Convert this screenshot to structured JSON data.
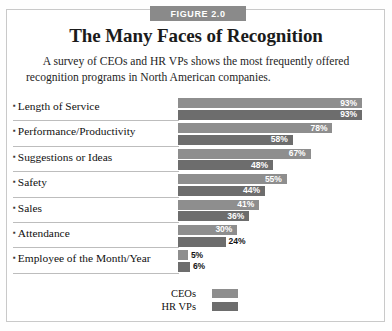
{
  "figure": {
    "banner_label": "FIGURE 2.0",
    "title": "The Many Faces of Recognition",
    "subtitle_line1": "A survey of CEOs and HR VPs shows the most frequently offered",
    "subtitle_line2": "recognition programs in North American companies."
  },
  "legend": {
    "items": [
      {
        "label": "CEOs",
        "color": "#8e8e8e"
      },
      {
        "label": "HR VPs",
        "color": "#6d6d6d"
      }
    ]
  },
  "rows": [
    {
      "label": "Length of Service",
      "ceo": "93%",
      "hr": "93%"
    },
    {
      "label": "Performance/Productivity",
      "ceo": "78%",
      "hr": "58%"
    },
    {
      "label": "Suggestions or Ideas",
      "ceo": "67%",
      "hr": "48%"
    },
    {
      "label": "Safety",
      "ceo": "55%",
      "hr": "44%"
    },
    {
      "label": "Sales",
      "ceo": "41%",
      "hr": "36%"
    },
    {
      "label": "Attendance",
      "ceo": "30%",
      "hr": "24%"
    },
    {
      "label": "Employee of the Month/Year",
      "ceo": "5%",
      "hr": "6%"
    }
  ],
  "chart_data": {
    "type": "bar",
    "orientation": "horizontal",
    "title": "The Many Faces of Recognition",
    "subtitle": "A survey of CEOs and HR VPs shows the most frequently offered recognition programs in North American companies.",
    "xlabel": "",
    "ylabel": "",
    "xlim": [
      0,
      100
    ],
    "grid": false,
    "legend_position": "bottom-center",
    "value_suffix": "%",
    "categories": [
      "Length of Service",
      "Performance/Productivity",
      "Suggestions or Ideas",
      "Safety",
      "Sales",
      "Attendance",
      "Employee of the Month/Year"
    ],
    "series": [
      {
        "name": "CEOs",
        "color": "#8e8e8e",
        "values": [
          93,
          78,
          67,
          55,
          41,
          30,
          5
        ]
      },
      {
        "name": "HR VPs",
        "color": "#6d6d6d",
        "values": [
          93,
          58,
          48,
          44,
          36,
          24,
          6
        ]
      }
    ]
  }
}
